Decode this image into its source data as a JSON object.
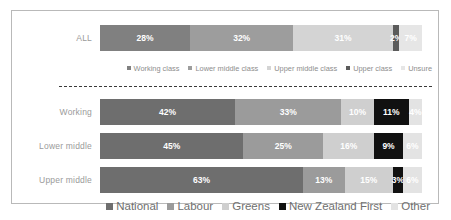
{
  "chart_data": {
    "type": "bar",
    "orientation": "horizontal",
    "stacked": true,
    "normalized_percent": true,
    "title": "",
    "xlabel": "",
    "ylabel": "",
    "xlim": [
      0,
      100
    ],
    "grid": false,
    "panels": [
      {
        "id": "all-panel",
        "legend_position": "below",
        "categories": [
          "ALL"
        ],
        "series": [
          {
            "name": "Working class",
            "color": "#808080",
            "values": [
              28
            ]
          },
          {
            "name": "Lower middle class",
            "color": "#9d9d9d",
            "values": [
              32
            ]
          },
          {
            "name": "Upper middle class",
            "color": "#d4d4d4",
            "values": [
              31
            ]
          },
          {
            "name": "Upper class",
            "color": "#5b5b5b",
            "values": [
              2
            ]
          },
          {
            "name": "Unsure",
            "color": "#e6e6e6",
            "values": [
              7
            ]
          }
        ],
        "labels": [
          "28%",
          "32%",
          "31%",
          "2%",
          "7%"
        ]
      },
      {
        "id": "party-panel",
        "legend_position": "below",
        "categories": [
          "Working",
          "Lower middle",
          "Upper middle"
        ],
        "series": [
          {
            "name": "National",
            "color": "#6e6e6e",
            "values": [
              42,
              45,
              63
            ]
          },
          {
            "name": "Labour",
            "color": "#9b9b9b",
            "values": [
              33,
              25,
              13
            ]
          },
          {
            "name": "Greens",
            "color": "#cfcfcf",
            "values": [
              10,
              16,
              15
            ]
          },
          {
            "name": "New Zealand First",
            "color": "#111111",
            "values": [
              11,
              9,
              3
            ]
          },
          {
            "name": "Other",
            "color": "#e3e3e3",
            "values": [
              4,
              6,
              6
            ]
          }
        ],
        "labels": [
          [
            "42%",
            "33%",
            "10%",
            "11%",
            "4%"
          ],
          [
            "45%",
            "25%",
            "16%",
            "9%",
            "6%"
          ],
          [
            "63%",
            "13%",
            "15%",
            "3%",
            "6%"
          ]
        ]
      }
    ]
  },
  "rows": {
    "all": {
      "label": "ALL"
    },
    "working": {
      "label": "Working"
    },
    "lower_middle": {
      "label": "Lower middle"
    },
    "upper_middle": {
      "label": "Upper middle"
    }
  },
  "legend_top": [
    {
      "label": "Working class",
      "color": "#808080"
    },
    {
      "label": "Lower middle class",
      "color": "#9d9d9d"
    },
    {
      "label": "Upper middle class",
      "color": "#d4d4d4"
    },
    {
      "label": "Upper class",
      "color": "#5b5b5b"
    },
    {
      "label": "Unsure",
      "color": "#e6e6e6"
    }
  ],
  "legend_bottom": [
    {
      "label": "National",
      "color": "#6e6e6e"
    },
    {
      "label": "Labour",
      "color": "#9b9b9b"
    },
    {
      "label": "Greens",
      "color": "#cfcfcf"
    },
    {
      "label": "New Zealand First",
      "color": "#111111"
    },
    {
      "label": "Other",
      "color": "#e3e3e3"
    }
  ]
}
